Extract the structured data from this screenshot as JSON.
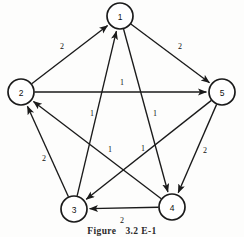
{
  "figure": {
    "caption_label": "Figure",
    "caption_number": "3.2 E-1",
    "caption_full": "Figure   3.2 E-1"
  },
  "graph": {
    "nodes": [
      {
        "id": "1",
        "label": "1",
        "cx": 120,
        "cy": 16,
        "r": 13
      },
      {
        "id": "2",
        "label": "2",
        "cx": 21,
        "cy": 92,
        "r": 13
      },
      {
        "id": "5",
        "label": "5",
        "cx": 222,
        "cy": 92,
        "r": 13
      },
      {
        "id": "3",
        "label": "3",
        "cx": 74,
        "cy": 209,
        "r": 13
      },
      {
        "id": "4",
        "label": "4",
        "cx": 172,
        "cy": 207,
        "r": 13
      }
    ],
    "edges": [
      {
        "from": "2",
        "to": "1",
        "weight": "2",
        "lx": 62,
        "ly": 46
      },
      {
        "from": "1",
        "to": "5",
        "weight": "2",
        "lx": 180,
        "ly": 46
      },
      {
        "from": "2",
        "to": "5",
        "weight": "1",
        "lx": 122,
        "ly": 82
      },
      {
        "from": "3",
        "to": "1",
        "weight": "1",
        "lx": 92,
        "ly": 113
      },
      {
        "from": "1",
        "to": "4",
        "weight": "1",
        "lx": 155,
        "ly": 113
      },
      {
        "from": "4",
        "to": "2",
        "weight": "1",
        "lx": 110,
        "ly": 149
      },
      {
        "from": "5",
        "to": "3",
        "weight": "1",
        "lx": 143,
        "ly": 148
      },
      {
        "from": "3",
        "to": "2",
        "weight": "2",
        "lx": 44,
        "ly": 158
      },
      {
        "from": "5",
        "to": "4",
        "weight": "2",
        "lx": 205,
        "ly": 150
      },
      {
        "from": "4",
        "to": "3",
        "weight": "2",
        "lx": 122,
        "ly": 220
      }
    ]
  },
  "colors": {
    "ink": "#1a1a1a",
    "paper": "#fdfdfc"
  }
}
